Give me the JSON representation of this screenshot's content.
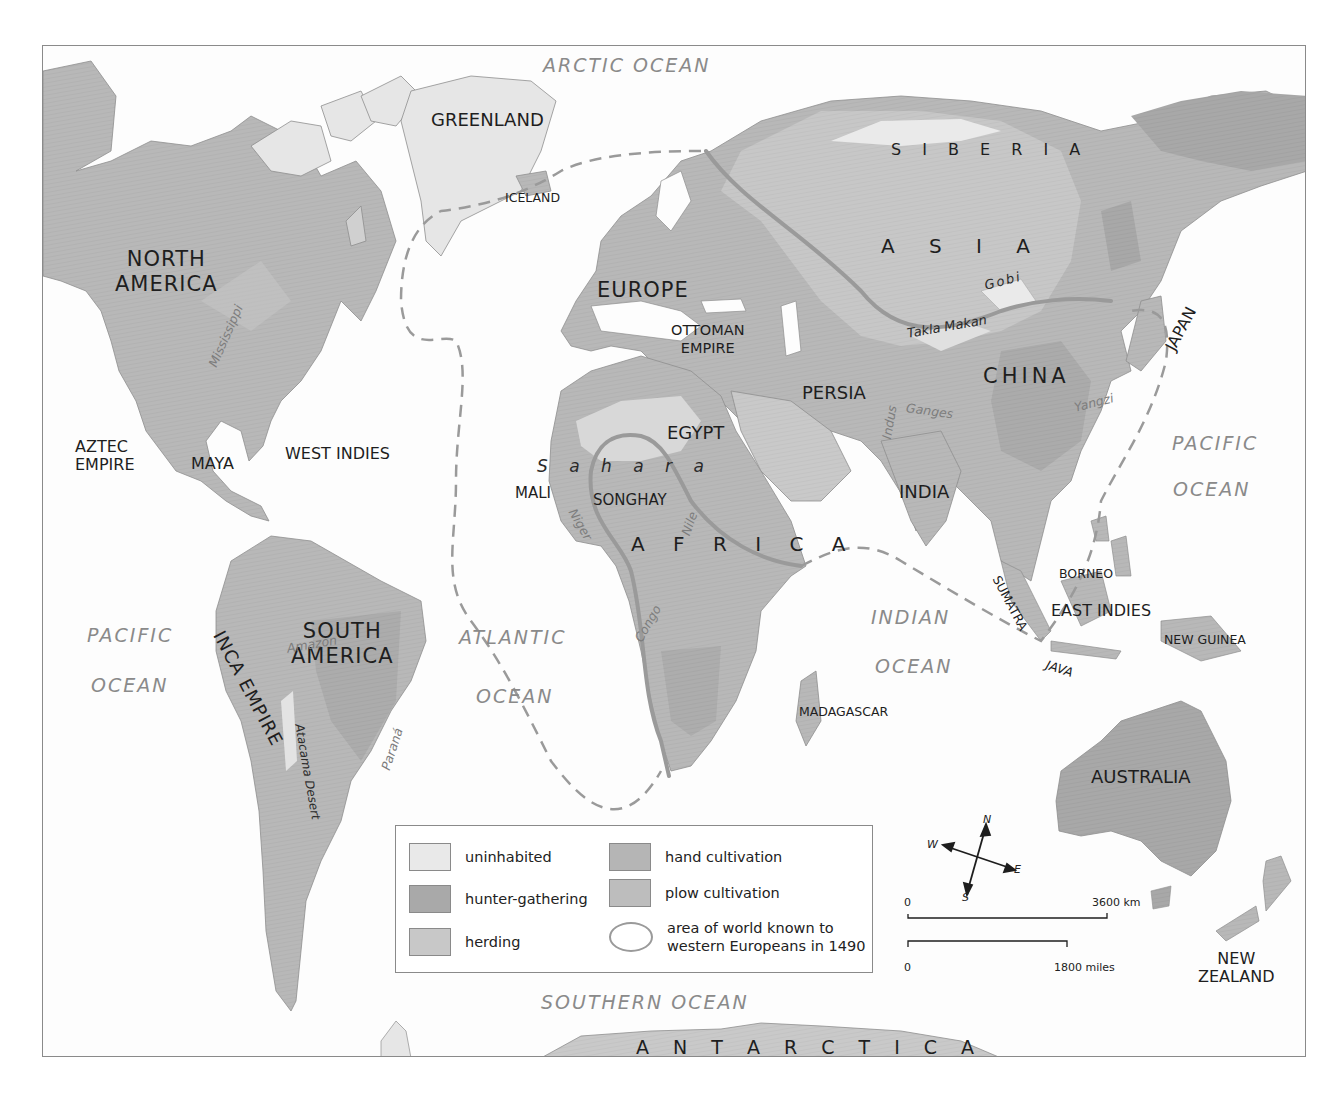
{
  "map": {
    "colors": {
      "ocean": "#fdfdfd",
      "uninhabited": "#e9e9e9",
      "hunter_gathering": "#a9a9a9",
      "herding": "#c8c8c8",
      "hand_cultivation": "#b5b5b5",
      "plow_cultivation": "#bdbdbd",
      "known_world_line": "#9a9a9a",
      "dashed_boundary": "#9a9a9a"
    },
    "oceans": {
      "arctic": "ARCTIC OCEAN",
      "pacific_west_1": "PACIFIC",
      "pacific_west_2": "OCEAN",
      "atlantic_1": "ATLANTIC",
      "atlantic_2": "OCEAN",
      "indian_1": "INDIAN",
      "indian_2": "OCEAN",
      "pacific_east_1": "PACIFIC",
      "pacific_east_2": "OCEAN",
      "southern": "SOUTHERN OCEAN"
    },
    "regions": {
      "greenland": "GREENLAND",
      "iceland": "ICELAND",
      "siberia": "S I B E R I A",
      "north_america_1": "NORTH",
      "north_america_2": "AMERICA",
      "europe": "EUROPE",
      "asia": "A S I A",
      "ottoman_1": "OTTOMAN",
      "ottoman_2": "EMPIRE",
      "persia": "PERSIA",
      "china": "CHINA",
      "japan": "JAPAN",
      "egypt": "EGYPT",
      "india": "INDIA",
      "aztec_1": "AZTEC",
      "aztec_2": "EMPIRE",
      "maya": "MAYA",
      "west_indies": "WEST INDIES",
      "mali": "MALI",
      "songhay": "SONGHAY",
      "africa": "A F R I C A",
      "south_america_1": "SOUTH",
      "south_america_2": "AMERICA",
      "inca_empire": "INCA EMPIRE",
      "madagascar": "MADAGASCAR",
      "borneo": "BORNEO",
      "east_indies": "EAST INDIES",
      "sumatra": "SUMATRA",
      "java": "JAVA",
      "new_guinea": "NEW GUINEA",
      "australia": "AUSTRALIA",
      "new_zealand_1": "NEW",
      "new_zealand_2": "ZEALAND",
      "antarctica": "A N T A R C T I C A"
    },
    "physical": {
      "gobi": "Gobi",
      "takla_makan": "Takla Makan",
      "sahara": "S a h a r a",
      "atacama": "Atacama Desert",
      "mississippi": "Mississippi",
      "amazon": "Amazon",
      "parana": "Paraná",
      "niger": "Niger",
      "nile": "Nile",
      "congo": "Congo",
      "indus": "Indus",
      "ganges": "Ganges",
      "yangzi": "Yangzi"
    },
    "legend": {
      "items": [
        {
          "label": "uninhabited",
          "color": "#e9e9e9"
        },
        {
          "label": "hunter-gathering",
          "color": "#a9a9a9"
        },
        {
          "label": "herding",
          "color": "#c8c8c8"
        },
        {
          "label": "hand cultivation",
          "color": "#b5b5b5"
        },
        {
          "label": "plow cultivation",
          "color": "#bdbdbd"
        }
      ],
      "known_world_1": "area of world known to",
      "known_world_2": "western Europeans in 1490"
    },
    "compass": {
      "n": "N",
      "s": "S",
      "e": "E",
      "w": "W"
    },
    "scale": {
      "km_zero": "0",
      "km_max": "3600 km",
      "mi_zero": "0",
      "mi_max": "1800 miles"
    }
  }
}
